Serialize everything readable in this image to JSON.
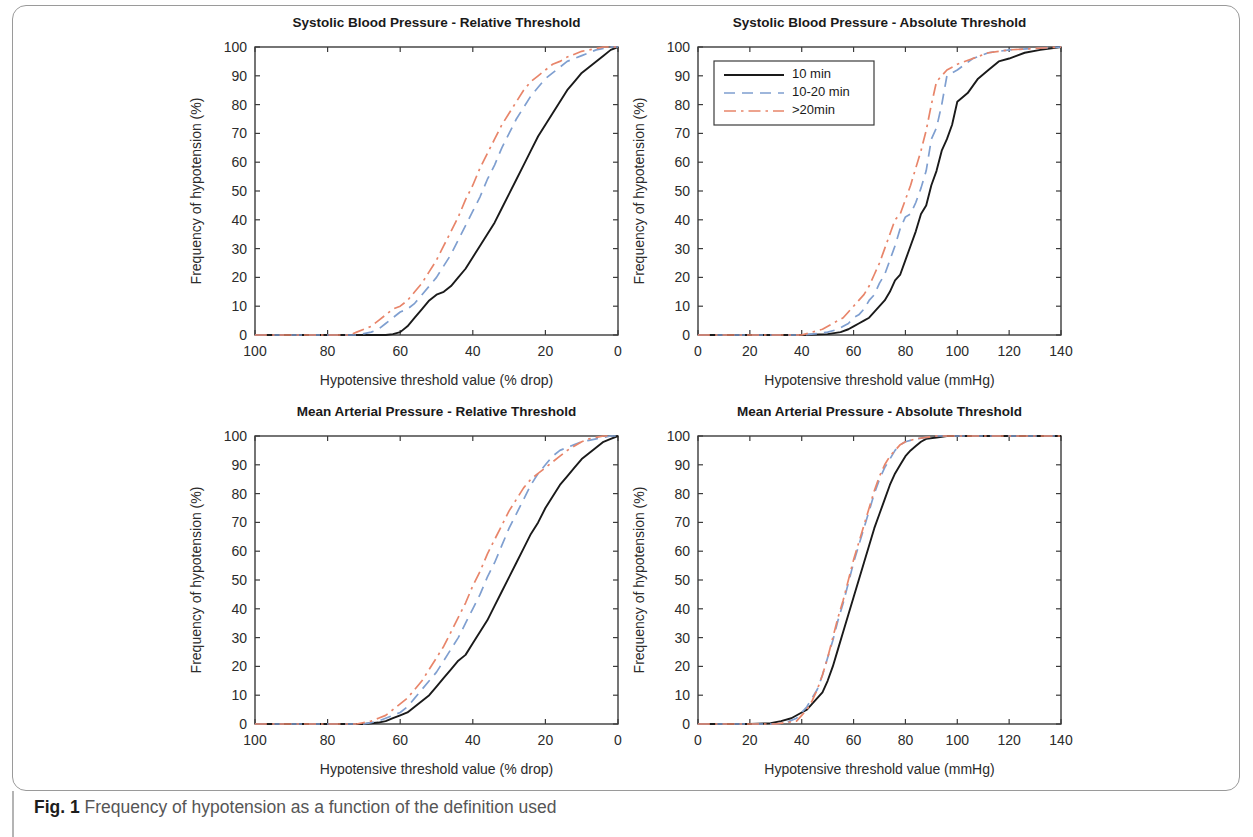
{
  "figure": {
    "caption_label": "Fig. 1",
    "caption_text": "Frequency of hypotension as a function of the definition used"
  },
  "style": {
    "color_10min": "#1a1a1a",
    "color_10_20min": "#7f9fd0",
    "color_gt20min": "#e8856a",
    "axis_color": "#3b3b3b"
  },
  "legend": {
    "position": "top-left of Systolic Blood Pressure - Absolute Threshold panel",
    "entries": [
      {
        "label": "10 min",
        "style": "solid",
        "color": "#1a1a1a"
      },
      {
        "label": "10-20 min",
        "style": "dashed",
        "color": "#7f9fd0"
      },
      {
        "label": ">20min",
        "style": "dashdot",
        "color": "#e8856a"
      }
    ]
  },
  "chart_data": [
    {
      "id": "sbp_relative",
      "type": "line",
      "title": "Systolic Blood Pressure - Relative Threshold",
      "xlabel": "Hypotensive threshold value (% drop)",
      "ylabel": "Frequency of hypotension (%)",
      "xlim": [
        100,
        0
      ],
      "ylim": [
        0,
        100
      ],
      "x_reversed": true,
      "xticks": [
        100,
        80,
        60,
        40,
        20,
        0
      ],
      "yticks": [
        0,
        10,
        20,
        30,
        40,
        50,
        60,
        70,
        80,
        90,
        100
      ],
      "grid": false,
      "series": [
        {
          "name": "10 min",
          "style": "solid",
          "color": "#1a1a1a",
          "x": [
            100,
            80,
            70,
            66,
            64,
            62,
            60,
            58,
            56,
            54,
            52,
            50,
            48,
            46,
            44,
            42,
            40,
            38,
            36,
            34,
            32,
            30,
            28,
            26,
            24,
            22,
            20,
            18,
            16,
            14,
            12,
            10,
            8,
            6,
            4,
            2,
            0
          ],
          "y": [
            0,
            0,
            0,
            0,
            0,
            0.3,
            1,
            3,
            6,
            9,
            12,
            14,
            15,
            17,
            20,
            23,
            27,
            31,
            35,
            39,
            44,
            49,
            54,
            59,
            64,
            69,
            73,
            77,
            81,
            85,
            88,
            91,
            93,
            95,
            97,
            99,
            100
          ]
        },
        {
          "name": "10-20 min",
          "style": "dashed",
          "color": "#7f9fd0",
          "x": [
            100,
            80,
            72,
            70,
            68,
            66,
            64,
            62,
            60,
            58,
            56,
            54,
            52,
            50,
            48,
            46,
            44,
            42,
            40,
            38,
            36,
            34,
            32,
            30,
            28,
            26,
            24,
            22,
            20,
            18,
            16,
            14,
            12,
            10,
            8,
            6,
            4,
            2,
            0
          ],
          "y": [
            0,
            0,
            0,
            0.5,
            1,
            2,
            4,
            6,
            8,
            9,
            11,
            14,
            17,
            20,
            24,
            28,
            33,
            38,
            43,
            48,
            54,
            59,
            65,
            70,
            75,
            79,
            83,
            86,
            89,
            91,
            93,
            95,
            96,
            97,
            98,
            99,
            99.5,
            100,
            100
          ]
        },
        {
          "name": ">20min",
          "style": "dashdot",
          "color": "#e8856a",
          "x": [
            100,
            80,
            74,
            72,
            70,
            68,
            66,
            64,
            62,
            60,
            58,
            56,
            54,
            52,
            50,
            48,
            46,
            44,
            42,
            40,
            38,
            36,
            34,
            32,
            30,
            28,
            26,
            24,
            22,
            20,
            18,
            16,
            14,
            12,
            10,
            8,
            6,
            4,
            2,
            0
          ],
          "y": [
            0,
            0,
            0,
            1,
            2,
            3,
            5,
            7,
            9,
            10,
            12,
            15,
            18,
            22,
            26,
            31,
            36,
            41,
            47,
            52,
            58,
            63,
            68,
            73,
            77,
            81,
            85,
            88,
            90,
            92,
            94,
            95,
            96.5,
            97.5,
            98.5,
            99,
            99.5,
            100,
            100,
            100
          ]
        }
      ]
    },
    {
      "id": "sbp_absolute",
      "type": "line",
      "title": "Systolic Blood Pressure - Absolute Threshold",
      "xlabel": "Hypotensive threshold value (mmHg)",
      "ylabel": "Frequency of hypotension (%)",
      "xlim": [
        0,
        140
      ],
      "ylim": [
        0,
        100
      ],
      "x_reversed": false,
      "xticks": [
        0,
        20,
        40,
        60,
        80,
        100,
        120,
        140
      ],
      "yticks": [
        0,
        10,
        20,
        30,
        40,
        50,
        60,
        70,
        80,
        90,
        100
      ],
      "grid": false,
      "series": [
        {
          "name": "10 min",
          "style": "solid",
          "color": "#1a1a1a",
          "x": [
            0,
            20,
            40,
            50,
            55,
            58,
            60,
            62,
            64,
            66,
            68,
            70,
            72,
            74,
            76,
            78,
            80,
            82,
            84,
            86,
            88,
            90,
            92,
            94,
            96,
            98,
            100,
            104,
            108,
            112,
            116,
            120,
            126,
            132,
            140
          ],
          "y": [
            0,
            0,
            0,
            0.3,
            1,
            2,
            3,
            4,
            5,
            6,
            8,
            10,
            12,
            15,
            19,
            21,
            26,
            31,
            36,
            42,
            45,
            52,
            57,
            64,
            68,
            73,
            81,
            84,
            89,
            92,
            95,
            96,
            98,
            99,
            100
          ]
        },
        {
          "name": "10-20 min",
          "style": "dashed",
          "color": "#7f9fd0",
          "x": [
            0,
            20,
            40,
            46,
            50,
            54,
            56,
            58,
            60,
            62,
            64,
            66,
            68,
            70,
            72,
            74,
            76,
            78,
            80,
            82,
            84,
            86,
            88,
            90,
            92,
            94,
            96,
            100,
            106,
            112,
            120,
            130,
            140
          ],
          "y": [
            0,
            0,
            0,
            0.5,
            1,
            2,
            3,
            4,
            6,
            7,
            9,
            12,
            14,
            18,
            21,
            26,
            31,
            37,
            41,
            42,
            46,
            51,
            57,
            68,
            72,
            80,
            90,
            92,
            96,
            98,
            99,
            99.5,
            100
          ]
        },
        {
          "name": ">20min",
          "style": "dashdot",
          "color": "#e8856a",
          "x": [
            0,
            20,
            40,
            44,
            48,
            52,
            54,
            56,
            58,
            60,
            62,
            64,
            66,
            68,
            70,
            72,
            74,
            76,
            78,
            80,
            82,
            84,
            86,
            88,
            90,
            92,
            96,
            100,
            106,
            112,
            120,
            130,
            140
          ],
          "y": [
            0,
            0,
            0,
            1,
            2,
            4,
            5,
            6,
            8,
            10,
            12,
            14,
            17,
            21,
            25,
            30,
            35,
            40,
            42,
            47,
            52,
            58,
            64,
            71,
            80,
            88,
            92,
            94,
            96,
            98,
            99,
            99.5,
            100
          ]
        }
      ]
    },
    {
      "id": "map_relative",
      "type": "line",
      "title": "Mean Arterial Pressure - Relative Threshold",
      "xlabel": "Hypotensive threshold value (% drop)",
      "ylabel": "Frequency of hypotension (%)",
      "xlim": [
        100,
        0
      ],
      "ylim": [
        0,
        100
      ],
      "x_reversed": true,
      "xticks": [
        100,
        80,
        60,
        40,
        20,
        0
      ],
      "yticks": [
        0,
        10,
        20,
        30,
        40,
        50,
        60,
        70,
        80,
        90,
        100
      ],
      "grid": false,
      "series": [
        {
          "name": "10 min",
          "style": "solid",
          "color": "#1a1a1a",
          "x": [
            100,
            80,
            70,
            66,
            64,
            62,
            60,
            58,
            56,
            54,
            52,
            50,
            48,
            46,
            44,
            42,
            40,
            38,
            36,
            34,
            32,
            30,
            28,
            26,
            24,
            22,
            20,
            18,
            16,
            14,
            12,
            10,
            8,
            6,
            4,
            2,
            0
          ],
          "y": [
            0,
            0,
            0,
            0.5,
            1,
            2,
            3,
            4,
            6,
            8,
            10,
            13,
            16,
            19,
            22,
            24,
            28,
            32,
            36,
            41,
            46,
            51,
            56,
            61,
            66,
            70,
            75,
            79,
            83,
            86,
            89,
            92,
            94,
            96,
            98,
            99,
            100
          ]
        },
        {
          "name": "10-20 min",
          "style": "dashed",
          "color": "#7f9fd0",
          "x": [
            100,
            80,
            70,
            68,
            66,
            64,
            62,
            60,
            58,
            56,
            54,
            52,
            50,
            48,
            46,
            44,
            42,
            40,
            38,
            36,
            34,
            32,
            30,
            28,
            26,
            24,
            22,
            20,
            18,
            16,
            14,
            12,
            10,
            8,
            6,
            4,
            2,
            0
          ],
          "y": [
            0,
            0,
            0,
            0.5,
            1,
            2,
            3,
            4,
            6,
            9,
            12,
            15,
            18,
            22,
            26,
            30,
            35,
            40,
            45,
            51,
            56,
            62,
            68,
            73,
            78,
            83,
            87,
            90,
            93,
            95,
            96,
            97,
            98,
            98.5,
            99,
            99.5,
            100,
            100
          ]
        },
        {
          "name": ">20min",
          "style": "dashdot",
          "color": "#e8856a",
          "x": [
            100,
            80,
            72,
            70,
            68,
            66,
            64,
            62,
            60,
            58,
            56,
            54,
            52,
            50,
            48,
            46,
            44,
            42,
            40,
            38,
            36,
            34,
            32,
            30,
            28,
            26,
            24,
            22,
            20,
            18,
            16,
            14,
            12,
            10,
            8,
            6,
            4,
            2,
            0
          ],
          "y": [
            0,
            0,
            0,
            0.5,
            1,
            2,
            3,
            5,
            7,
            9,
            12,
            15,
            19,
            23,
            27,
            32,
            37,
            42,
            48,
            53,
            59,
            64,
            69,
            74,
            78,
            82,
            85,
            87,
            89,
            91,
            93,
            95,
            96.5,
            98,
            99,
            99.5,
            100,
            100
          ]
        }
      ]
    },
    {
      "id": "map_absolute",
      "type": "line",
      "title": "Mean Arterial Pressure - Absolute Threshold",
      "xlabel": "Hypotensive threshold value (mmHg)",
      "ylabel": "Frequency of hypotension (%)",
      "xlim": [
        0,
        140
      ],
      "ylim": [
        0,
        100
      ],
      "x_reversed": false,
      "xticks": [
        0,
        20,
        40,
        60,
        80,
        100,
        120,
        140
      ],
      "yticks": [
        0,
        10,
        20,
        30,
        40,
        50,
        60,
        70,
        80,
        90,
        100
      ],
      "grid": false,
      "series": [
        {
          "name": "10 min",
          "style": "solid",
          "color": "#1a1a1a",
          "x": [
            0,
            20,
            28,
            32,
            36,
            40,
            42,
            44,
            46,
            48,
            50,
            52,
            54,
            56,
            58,
            60,
            62,
            64,
            66,
            68,
            70,
            72,
            74,
            76,
            78,
            80,
            82,
            84,
            86,
            88,
            92,
            96,
            100,
            110,
            120,
            130,
            140
          ],
          "y": [
            0,
            0,
            0.3,
            1,
            2,
            4,
            5,
            7,
            9,
            11,
            15,
            20,
            26,
            32,
            38,
            44,
            50,
            56,
            62,
            68,
            73,
            78,
            83,
            87,
            90,
            93,
            95,
            96.5,
            98,
            99,
            99.5,
            100,
            100,
            100,
            100,
            100,
            100
          ]
        },
        {
          "name": "10-20 min",
          "style": "dashed",
          "color": "#7f9fd0",
          "x": [
            0,
            20,
            30,
            34,
            38,
            40,
            42,
            44,
            46,
            48,
            50,
            52,
            54,
            56,
            58,
            60,
            62,
            64,
            66,
            68,
            70,
            72,
            74,
            76,
            78,
            80,
            84,
            88,
            92,
            96,
            100,
            110,
            120,
            130,
            140
          ],
          "y": [
            0,
            0,
            0,
            0.5,
            2,
            4,
            6,
            9,
            12,
            17,
            23,
            29,
            36,
            42,
            49,
            56,
            62,
            68,
            74,
            80,
            85,
            89,
            92,
            95,
            97,
            98,
            99,
            99.5,
            100,
            100,
            100,
            100,
            100,
            100,
            100
          ]
        },
        {
          "name": ">20min",
          "style": "dashdot",
          "color": "#e8856a",
          "x": [
            0,
            20,
            30,
            34,
            38,
            40,
            42,
            44,
            46,
            48,
            50,
            52,
            54,
            56,
            58,
            60,
            62,
            64,
            66,
            68,
            70,
            72,
            74,
            76,
            78,
            80,
            84,
            88,
            92,
            96,
            100,
            110,
            120,
            130,
            140
          ],
          "y": [
            0,
            0,
            0,
            0.5,
            1,
            3,
            5,
            8,
            12,
            17,
            23,
            30,
            37,
            43,
            50,
            57,
            63,
            69,
            75,
            81,
            86,
            90,
            93,
            95,
            97,
            98,
            99,
            99.5,
            100,
            100,
            100,
            100,
            100,
            100,
            100
          ]
        }
      ]
    }
  ]
}
